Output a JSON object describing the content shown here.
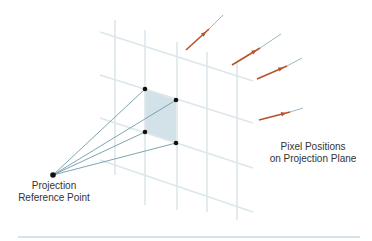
{
  "labels": {
    "reference_point": [
      "Projection",
      "Reference Point"
    ],
    "pixel_positions": [
      "Pixel Positions",
      "on Projection Plane"
    ]
  },
  "colors": {
    "grid": "#dce7ec",
    "ray": "#6f9aa8",
    "dot": "#111111",
    "pixel_fill": "#d3e1e8",
    "arrow": "#b5532b",
    "arrow_tail": "#8fb0bc",
    "rule": "#a9c6d3"
  },
  "diagram": {
    "reference_point": [
      53,
      175
    ],
    "pixel_corners": [
      [
        145,
        89
      ],
      [
        176,
        100
      ],
      [
        176,
        143
      ],
      [
        145,
        132
      ]
    ],
    "vertical_grid": [
      [
        115,
        20,
        115,
        175
      ],
      [
        145,
        30,
        145,
        205
      ],
      [
        177,
        42,
        177,
        210
      ],
      [
        207,
        52,
        207,
        212
      ],
      [
        237,
        62,
        237,
        220
      ]
    ],
    "horizontal_grid": [
      [
        100,
        32,
        253,
        81
      ],
      [
        100,
        75,
        253,
        123
      ],
      [
        100,
        118,
        253,
        168
      ],
      [
        100,
        160,
        253,
        212
      ]
    ],
    "arrows": [
      {
        "from": [
          186,
          50
        ],
        "to": [
          209,
          29
        ],
        "tail_end": [
          223,
          15
        ]
      },
      {
        "from": [
          232,
          65
        ],
        "to": [
          260,
          48
        ],
        "tail_end": [
          281,
          34
        ]
      },
      {
        "from": [
          257,
          79
        ],
        "to": [
          287,
          66
        ],
        "tail_end": [
          302,
          58
        ]
      },
      {
        "from": [
          259,
          120
        ],
        "to": [
          290,
          112
        ],
        "tail_end": [
          303,
          108
        ]
      }
    ],
    "rule": [
      18,
      237,
      360,
      237
    ]
  }
}
